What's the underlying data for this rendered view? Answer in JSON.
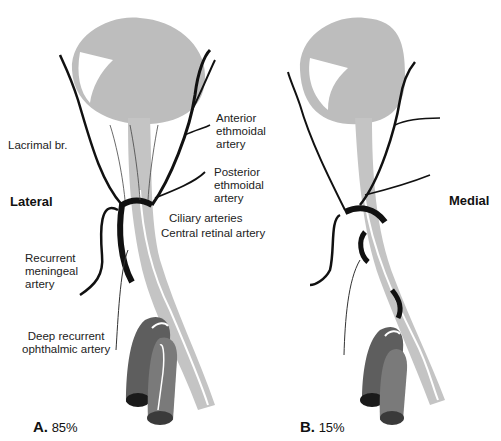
{
  "colors": {
    "globe": "#bdbdbd",
    "nerve": "#c4c4c4",
    "artery": "#111111",
    "carotid_dark": "#5e5e5e",
    "carotid_mid": "#7a7a7a",
    "background": "#ffffff"
  },
  "panels": [
    {
      "id": "A",
      "letter": "A.",
      "percent": "85%",
      "side_label": "Lateral",
      "labels": {
        "lacrimal": "Lacrimal br.",
        "anterior_ethmoidal": [
          "Anterior",
          "ethmoidal",
          "artery"
        ],
        "posterior_ethmoidal": [
          "Posterior",
          "ethmoidal",
          "artery"
        ],
        "ciliary": "Ciliary arteries",
        "central_retinal": "Central retinal artery",
        "recurrent_meningeal": [
          "Recurrent",
          "meningeal",
          "artery"
        ],
        "deep_recurrent": [
          "Deep recurrent",
          "ophthalmic artery"
        ]
      }
    },
    {
      "id": "B",
      "letter": "B.",
      "percent": "15%",
      "side_label": "Medial"
    }
  ]
}
